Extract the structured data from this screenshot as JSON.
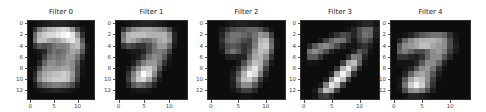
{
  "chart_data": {
    "type": "heatmap",
    "title": "",
    "colormap": "gray",
    "panels": [
      {
        "title": "Filter 0",
        "xticks": [
          0,
          5,
          10
        ],
        "yticks": [
          0,
          2,
          4,
          6,
          8,
          10,
          12
        ],
        "xlim": [
          -0.5,
          13.5
        ],
        "ylim": [
          13.5,
          -0.5
        ],
        "values": [
          [
            5,
            5,
            8,
            10,
            12,
            14,
            15,
            14,
            12,
            10,
            8,
            5,
            5,
            5
          ],
          [
            5,
            20,
            45,
            60,
            70,
            75,
            80,
            85,
            80,
            60,
            30,
            10,
            5,
            5
          ],
          [
            5,
            40,
            70,
            80,
            85,
            85,
            90,
            95,
            100,
            90,
            60,
            20,
            5,
            5
          ],
          [
            5,
            45,
            75,
            75,
            65,
            60,
            65,
            75,
            85,
            90,
            75,
            35,
            5,
            5
          ],
          [
            5,
            20,
            35,
            30,
            35,
            45,
            50,
            50,
            55,
            70,
            75,
            45,
            10,
            5
          ],
          [
            5,
            8,
            10,
            15,
            35,
            45,
            40,
            45,
            55,
            65,
            60,
            35,
            8,
            5
          ],
          [
            5,
            5,
            8,
            25,
            45,
            50,
            45,
            50,
            60,
            60,
            45,
            20,
            5,
            5
          ],
          [
            5,
            5,
            15,
            40,
            55,
            55,
            50,
            55,
            60,
            55,
            35,
            10,
            5,
            5
          ],
          [
            5,
            8,
            30,
            55,
            60,
            60,
            60,
            65,
            65,
            55,
            30,
            8,
            5,
            5
          ],
          [
            5,
            15,
            50,
            65,
            70,
            75,
            75,
            80,
            75,
            60,
            30,
            8,
            5,
            5
          ],
          [
            5,
            20,
            55,
            70,
            75,
            80,
            80,
            80,
            75,
            55,
            25,
            5,
            5,
            5
          ],
          [
            5,
            10,
            30,
            40,
            45,
            50,
            50,
            45,
            40,
            30,
            12,
            5,
            5,
            5
          ],
          [
            5,
            5,
            8,
            10,
            12,
            15,
            15,
            12,
            10,
            8,
            5,
            5,
            5,
            5
          ],
          [
            5,
            5,
            5,
            5,
            5,
            5,
            5,
            5,
            5,
            5,
            5,
            5,
            5,
            5
          ]
        ]
      },
      {
        "title": "Filter 1",
        "xticks": [
          0,
          5,
          10
        ],
        "yticks": [
          0,
          2,
          4,
          6,
          8,
          10,
          12
        ],
        "xlim": [
          -0.5,
          13.5
        ],
        "ylim": [
          13.5,
          -0.5
        ],
        "values": [
          [
            5,
            5,
            8,
            10,
            12,
            14,
            14,
            12,
            10,
            8,
            5,
            5,
            5,
            5
          ],
          [
            5,
            20,
            40,
            55,
            60,
            65,
            65,
            60,
            55,
            50,
            30,
            8,
            5,
            5
          ],
          [
            5,
            45,
            70,
            75,
            75,
            75,
            70,
            70,
            70,
            70,
            55,
            15,
            5,
            5
          ],
          [
            5,
            50,
            70,
            65,
            55,
            45,
            45,
            55,
            65,
            70,
            60,
            15,
            5,
            5
          ],
          [
            5,
            20,
            30,
            25,
            20,
            20,
            30,
            45,
            60,
            60,
            40,
            10,
            5,
            5
          ],
          [
            5,
            5,
            8,
            10,
            10,
            15,
            30,
            45,
            50,
            45,
            25,
            5,
            5,
            5
          ],
          [
            5,
            5,
            5,
            8,
            12,
            25,
            45,
            55,
            50,
            35,
            12,
            5,
            5,
            5
          ],
          [
            5,
            5,
            5,
            12,
            30,
            50,
            60,
            60,
            45,
            20,
            8,
            5,
            5,
            5
          ],
          [
            5,
            5,
            10,
            30,
            55,
            75,
            80,
            65,
            35,
            10,
            5,
            5,
            5,
            5
          ],
          [
            5,
            5,
            20,
            50,
            75,
            100,
            85,
            55,
            20,
            5,
            5,
            5,
            5,
            5
          ],
          [
            5,
            5,
            25,
            55,
            80,
            85,
            65,
            35,
            10,
            5,
            5,
            5,
            5,
            5
          ],
          [
            5,
            5,
            15,
            35,
            45,
            40,
            30,
            15,
            5,
            5,
            5,
            5,
            5,
            5
          ],
          [
            5,
            5,
            5,
            8,
            10,
            10,
            8,
            5,
            5,
            5,
            5,
            5,
            5,
            5
          ],
          [
            5,
            5,
            5,
            5,
            5,
            5,
            5,
            5,
            5,
            5,
            5,
            5,
            5,
            5
          ]
        ]
      },
      {
        "title": "Filter 2",
        "xticks": [
          0,
          5,
          10
        ],
        "yticks": [
          0,
          2,
          4,
          6,
          8,
          10,
          12
        ],
        "xlim": [
          -0.5,
          13.5
        ],
        "ylim": [
          13.5,
          -0.5
        ],
        "values": [
          [
            5,
            5,
            5,
            8,
            10,
            12,
            12,
            10,
            10,
            8,
            5,
            5,
            5,
            5
          ],
          [
            5,
            5,
            10,
            20,
            30,
            35,
            35,
            40,
            40,
            35,
            20,
            8,
            5,
            5
          ],
          [
            5,
            5,
            15,
            35,
            45,
            45,
            40,
            35,
            45,
            60,
            55,
            25,
            5,
            5
          ],
          [
            5,
            5,
            20,
            40,
            45,
            40,
            30,
            25,
            45,
            70,
            75,
            40,
            8,
            5
          ],
          [
            5,
            5,
            15,
            30,
            35,
            30,
            20,
            25,
            50,
            75,
            80,
            45,
            8,
            5
          ],
          [
            5,
            5,
            10,
            35,
            45,
            35,
            20,
            30,
            60,
            75,
            70,
            35,
            5,
            5
          ],
          [
            5,
            5,
            5,
            12,
            15,
            12,
            15,
            40,
            65,
            70,
            55,
            20,
            5,
            5
          ],
          [
            5,
            5,
            5,
            5,
            5,
            10,
            30,
            55,
            75,
            70,
            40,
            10,
            5,
            5
          ],
          [
            5,
            5,
            5,
            5,
            8,
            20,
            50,
            75,
            90,
            65,
            25,
            5,
            5,
            5
          ],
          [
            5,
            5,
            5,
            5,
            12,
            35,
            70,
            95,
            85,
            50,
            15,
            5,
            5,
            5
          ],
          [
            5,
            5,
            5,
            5,
            15,
            45,
            75,
            80,
            60,
            25,
            8,
            5,
            5,
            5
          ],
          [
            5,
            5,
            5,
            5,
            12,
            35,
            55,
            55,
            35,
            12,
            5,
            5,
            5,
            5
          ],
          [
            5,
            5,
            5,
            5,
            8,
            15,
            25,
            25,
            15,
            5,
            5,
            5,
            5,
            5
          ],
          [
            5,
            5,
            5,
            5,
            5,
            5,
            8,
            8,
            5,
            5,
            5,
            5,
            5,
            5
          ]
        ]
      },
      {
        "title": "Filter 3",
        "xticks": [
          0,
          5,
          10
        ],
        "yticks": [
          0,
          2,
          4,
          6,
          8,
          10,
          12
        ],
        "xlim": [
          -0.5,
          13.5
        ],
        "ylim": [
          13.5,
          -0.5
        ],
        "values": [
          [
            5,
            5,
            5,
            5,
            5,
            5,
            5,
            5,
            5,
            8,
            10,
            15,
            15,
            8
          ],
          [
            5,
            5,
            5,
            5,
            5,
            5,
            5,
            5,
            8,
            15,
            30,
            40,
            40,
            15
          ],
          [
            5,
            5,
            5,
            5,
            5,
            10,
            20,
            30,
            25,
            15,
            30,
            45,
            40,
            12
          ],
          [
            5,
            5,
            5,
            10,
            25,
            40,
            50,
            45,
            25,
            10,
            25,
            35,
            25,
            8
          ],
          [
            5,
            15,
            35,
            50,
            55,
            45,
            30,
            15,
            8,
            8,
            15,
            20,
            12,
            5
          ],
          [
            5,
            45,
            55,
            45,
            30,
            15,
            8,
            5,
            5,
            15,
            35,
            25,
            8,
            5
          ],
          [
            5,
            35,
            35,
            20,
            8,
            5,
            5,
            5,
            20,
            50,
            45,
            15,
            5,
            5
          ],
          [
            5,
            8,
            8,
            5,
            5,
            5,
            5,
            25,
            65,
            75,
            40,
            8,
            5,
            5
          ],
          [
            5,
            5,
            5,
            5,
            5,
            5,
            20,
            70,
            90,
            55,
            15,
            5,
            5,
            5
          ],
          [
            5,
            5,
            5,
            5,
            5,
            15,
            65,
            95,
            70,
            20,
            5,
            5,
            5,
            5
          ],
          [
            5,
            5,
            5,
            5,
            12,
            60,
            95,
            75,
            25,
            5,
            5,
            5,
            5,
            5
          ],
          [
            5,
            5,
            5,
            10,
            50,
            90,
            75,
            25,
            5,
            5,
            5,
            5,
            5,
            5
          ],
          [
            5,
            5,
            10,
            40,
            75,
            65,
            25,
            5,
            5,
            5,
            5,
            5,
            5,
            5
          ],
          [
            5,
            5,
            8,
            20,
            25,
            15,
            5,
            5,
            5,
            5,
            5,
            5,
            5,
            5
          ]
        ]
      },
      {
        "title": "Filter 4",
        "xticks": [
          0,
          5,
          10
        ],
        "yticks": [
          0,
          2,
          4,
          6,
          8,
          10,
          12
        ],
        "xlim": [
          -0.5,
          13.5
        ],
        "ylim": [
          13.5,
          -0.5
        ],
        "values": [
          [
            5,
            5,
            5,
            5,
            5,
            5,
            5,
            5,
            5,
            5,
            5,
            5,
            5,
            5
          ],
          [
            5,
            5,
            5,
            5,
            5,
            5,
            5,
            5,
            5,
            5,
            5,
            5,
            5,
            5
          ],
          [
            5,
            5,
            8,
            15,
            25,
            35,
            40,
            45,
            45,
            40,
            20,
            8,
            5,
            5
          ],
          [
            5,
            15,
            40,
            55,
            65,
            70,
            70,
            70,
            65,
            55,
            30,
            10,
            5,
            5
          ],
          [
            5,
            35,
            55,
            60,
            65,
            75,
            75,
            65,
            60,
            55,
            30,
            12,
            5,
            5
          ],
          [
            5,
            40,
            50,
            40,
            30,
            30,
            40,
            55,
            60,
            50,
            25,
            10,
            5,
            5
          ],
          [
            5,
            20,
            20,
            15,
            12,
            20,
            40,
            55,
            55,
            35,
            15,
            5,
            5,
            5
          ],
          [
            5,
            8,
            8,
            8,
            15,
            35,
            55,
            55,
            40,
            15,
            5,
            5,
            5,
            5
          ],
          [
            5,
            5,
            8,
            15,
            35,
            55,
            60,
            45,
            20,
            8,
            5,
            5,
            5,
            5
          ],
          [
            5,
            5,
            15,
            40,
            60,
            65,
            55,
            35,
            12,
            5,
            5,
            5,
            5,
            5
          ],
          [
            5,
            8,
            35,
            65,
            80,
            75,
            55,
            25,
            8,
            5,
            5,
            5,
            5,
            5
          ],
          [
            5,
            10,
            45,
            80,
            95,
            80,
            50,
            20,
            5,
            5,
            5,
            5,
            5,
            5
          ],
          [
            5,
            8,
            30,
            55,
            60,
            50,
            30,
            12,
            5,
            5,
            5,
            5,
            5,
            5
          ],
          [
            5,
            5,
            8,
            15,
            15,
            12,
            8,
            5,
            5,
            5,
            5,
            5,
            5,
            5
          ]
        ]
      }
    ]
  },
  "layout": {
    "panels": [
      {
        "left": 28,
        "top": 21,
        "width": 66,
        "height": 78
      },
      {
        "left": 116,
        "top": 21,
        "width": 71,
        "height": 78
      },
      {
        "left": 208,
        "top": 21,
        "width": 77,
        "height": 78
      },
      {
        "left": 301,
        "top": 21,
        "width": 78,
        "height": 78
      },
      {
        "left": 391,
        "top": 21,
        "width": 79,
        "height": 78
      }
    ]
  }
}
